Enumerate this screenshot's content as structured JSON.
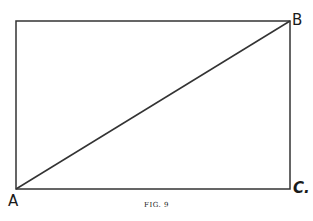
{
  "figure": {
    "caption": "FIG. 9",
    "labels": {
      "A": "A",
      "B": "B",
      "C": "C."
    },
    "shape": "rectangle with diagonal from A (bottom-left) to B (top-right)",
    "line_color": "#333333"
  }
}
